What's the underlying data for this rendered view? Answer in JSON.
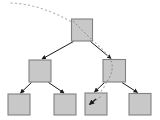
{
  "diagram": {
    "type": "tree",
    "canvas": {
      "width": 160,
      "height": 120
    },
    "colors": {
      "background": "#ffffff",
      "node_fill": "#c8c8c8",
      "node_stroke": "#828282",
      "edge": "#1a1a1a",
      "path": "#b4b4b4"
    },
    "style": {
      "node_stroke_width": 1.1,
      "edge_stroke_width": 1.0,
      "path_stroke_width": 1.1,
      "path_dash": "2.2,2.2"
    },
    "nodes": [
      {
        "id": "root",
        "label": "",
        "x": 71.5,
        "y": 19.0,
        "w": 21.0,
        "h": 22.0,
        "highlighted": true
      },
      {
        "id": "m1",
        "label": "",
        "x": 29.0,
        "y": 60.0,
        "w": 22.0,
        "h": 22.0,
        "highlighted": false
      },
      {
        "id": "m2",
        "label": "",
        "x": 103.0,
        "y": 59.5,
        "w": 22.5,
        "h": 22.5,
        "highlighted": true
      },
      {
        "id": "l1",
        "label": "",
        "x": 8.0,
        "y": 94.0,
        "w": 22.0,
        "h": 21.0,
        "highlighted": false
      },
      {
        "id": "l2",
        "label": "",
        "x": 54.0,
        "y": 94.0,
        "w": 22.0,
        "h": 21.0,
        "highlighted": false
      },
      {
        "id": "l3",
        "label": "",
        "x": 85.0,
        "y": 93.0,
        "w": 22.0,
        "h": 22.0,
        "highlighted": true
      },
      {
        "id": "l4",
        "label": "",
        "x": 129.0,
        "y": 93.5,
        "w": 22.0,
        "h": 21.5,
        "highlighted": false
      }
    ],
    "edges": [
      {
        "id": "edge-root-m1",
        "from": "root",
        "to": "m1",
        "kind": "solid",
        "arrow": true
      },
      {
        "id": "edge-root-m2",
        "from": "root",
        "to": "m2",
        "kind": "solid",
        "arrow": true
      },
      {
        "id": "edge-m1-l1",
        "from": "m1",
        "to": "l1",
        "kind": "solid",
        "arrow": true
      },
      {
        "id": "edge-m1-l2",
        "from": "m1",
        "to": "l2",
        "kind": "solid",
        "arrow": true
      },
      {
        "id": "edge-m2-l3",
        "from": "m2",
        "to": "l3",
        "kind": "solid",
        "arrow": true
      },
      {
        "id": "edge-m2-l4",
        "from": "m2",
        "to": "l4",
        "kind": "solid",
        "arrow": true
      }
    ],
    "traversal_path": {
      "id": "search-path",
      "kind": "dashed",
      "arrow": true,
      "description": "dashed path entering from upper left, passing through root and right middle node, ending inside third leaf"
    }
  }
}
